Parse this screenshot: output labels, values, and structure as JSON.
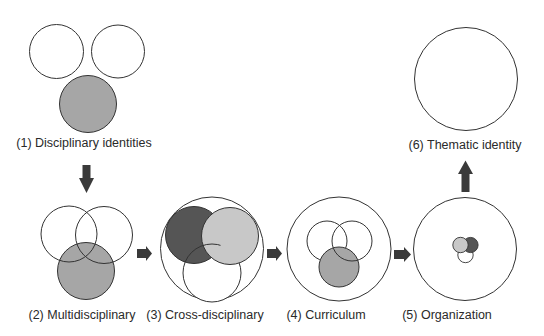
{
  "colors": {
    "outline": "#333333",
    "medium_gray": "#a6a6a6",
    "dark_gray": "#555555",
    "light_gray": "#c8c8c8",
    "white": "#ffffff",
    "arrow": "#3a3a3a"
  },
  "stages": [
    {
      "id": 1,
      "label": "(1) Disciplinary identities"
    },
    {
      "id": 2,
      "label": "(2) Multidisciplinary"
    },
    {
      "id": 3,
      "label": "(3) Cross-disciplinary"
    },
    {
      "id": 4,
      "label": "(4) Curriculum"
    },
    {
      "id": 5,
      "label": "(5) Organization"
    },
    {
      "id": 6,
      "label": "(6) Thematic identity"
    }
  ],
  "flow": [
    "1 → 2 (down)",
    "2 → 3 (right)",
    "3 → 4 (right)",
    "4 → 5 (right)",
    "5 → 6 (up)"
  ]
}
